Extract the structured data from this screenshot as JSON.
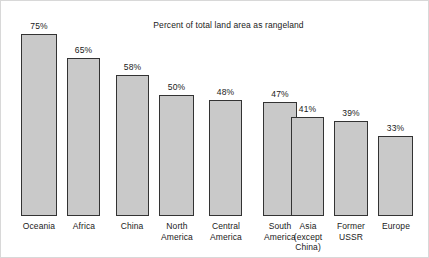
{
  "chart_data": {
    "type": "bar",
    "title": "Percent of total land area as rangeland",
    "xlabel": "",
    "ylabel": "",
    "ylim": [
      0,
      82
    ],
    "grid": false,
    "legend": null,
    "value_suffix": "%",
    "categories": [
      "Oceania",
      "Africa",
      "China",
      "North America",
      "Central America",
      "South America",
      "Asia (except China)",
      "Former USSR",
      "Europe"
    ],
    "category_lines": [
      [
        "Oceania"
      ],
      [
        "Africa"
      ],
      [
        "China"
      ],
      [
        "North",
        "America"
      ],
      [
        "Central",
        "America"
      ],
      [
        "South",
        "America"
      ],
      [
        "Asia",
        "(except",
        "China)"
      ],
      [
        "Former",
        "USSR"
      ],
      [
        "Europe"
      ]
    ],
    "values": [
      75,
      65,
      58,
      50,
      48,
      47,
      41,
      39,
      33
    ],
    "value_labels": [
      "75%",
      "65%",
      "58%",
      "50%",
      "48%",
      "47%",
      "41%",
      "39%",
      "33%"
    ],
    "colors": {
      "bar_fill": "#c9c9c9",
      "bar_border": "#333333",
      "text": "#1a1a1a",
      "background": "#ffffff",
      "frame": "#d8d8d8"
    }
  }
}
